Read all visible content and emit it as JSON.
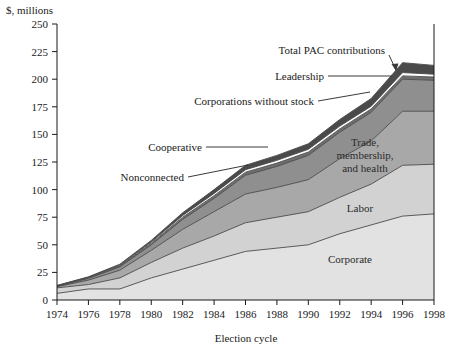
{
  "chart_data": {
    "type": "area",
    "title": "",
    "xlabel": "Election cycle",
    "ylabel": "$, millions",
    "x": [
      1974,
      1976,
      1978,
      1980,
      1982,
      1984,
      1986,
      1988,
      1990,
      1992,
      1994,
      1996,
      1998
    ],
    "xticklabels": [
      "1974",
      "1976",
      "1978",
      "1980",
      "1982",
      "1984",
      "1986",
      "1988",
      "1990",
      "1992",
      "1994",
      "1996",
      "1998"
    ],
    "yticklabels": [
      "0",
      "25",
      "50",
      "75",
      "100",
      "125",
      "150",
      "175",
      "200",
      "225",
      "250"
    ],
    "ylim": [
      0,
      250
    ],
    "xlim": [
      1974,
      1998
    ],
    "ytick_step": 25,
    "grid": false,
    "legend_position": "inline-annotations",
    "stacked": true,
    "series": [
      {
        "name": "Corporate",
        "color": "#e2e2e2",
        "values": [
          6,
          10,
          10,
          20,
          28,
          36,
          44,
          47,
          50,
          60,
          68,
          76,
          78
        ]
      },
      {
        "name": "Labor",
        "color": "#d2d2d2",
        "values": [
          5,
          4,
          10,
          14,
          19,
          22,
          26,
          28,
          30,
          33,
          37,
          46,
          45
        ]
      },
      {
        "name": "Trade, membership, and health",
        "color": "#a8a8a8",
        "values": [
          1,
          4,
          7,
          11,
          17,
          22,
          26,
          27,
          29,
          35,
          39,
          49,
          48
        ]
      },
      {
        "name": "Nonconnected",
        "color": "#8f8f8f",
        "values": [
          0.5,
          1.5,
          3,
          5,
          9,
          12,
          17,
          19,
          22,
          24,
          26,
          29,
          28
        ]
      },
      {
        "name": "Cooperative",
        "color": "#6e6e6e",
        "values": [
          0.3,
          0.7,
          1,
          1.5,
          2,
          2.5,
          2.8,
          3,
          3,
          3,
          3,
          3,
          3
        ]
      },
      {
        "name": "Corporations without stock",
        "color": "#ffffff",
        "values": [
          0.2,
          0.4,
          0.6,
          1,
          1.5,
          2,
          2.2,
          2.5,
          2.5,
          2.5,
          2.5,
          3,
          2.5
        ]
      },
      {
        "name": "Leadership",
        "color": "#4a4a4a",
        "values": [
          0.2,
          0.4,
          0.8,
          1.5,
          2.5,
          3.5,
          4,
          4.5,
          5,
          6,
          7,
          9,
          8
        ]
      }
    ],
    "total_label": "Total PAC contributions",
    "totals": [
      13.2,
      21.0,
      32.4,
      54.0,
      79.0,
      100.0,
      122.0,
      131.0,
      141.5,
      163.5,
      182.5,
      215.0,
      213.0
    ],
    "annotations": [
      {
        "name": "total-pac-contributions",
        "text": "Total PAC contributions",
        "connector": "arrow"
      },
      {
        "name": "leadership",
        "text": "Leadership",
        "connector": "line"
      },
      {
        "name": "corporations-without-stock",
        "text": "Corporations without stock",
        "connector": "line"
      },
      {
        "name": "cooperative",
        "text": "Cooperative",
        "connector": "line"
      },
      {
        "name": "nonconnected",
        "text": "Nonconnected",
        "connector": "line"
      }
    ],
    "inner_labels": [
      {
        "name": "trade-membership-health",
        "lines": [
          "Trade,",
          "membership,",
          "and health"
        ]
      },
      {
        "name": "labor",
        "lines": [
          "Labor"
        ]
      },
      {
        "name": "corporate",
        "lines": [
          "Corporate"
        ]
      }
    ]
  },
  "axes": {
    "y_axis_title": "$, millions",
    "x_axis_title": "Election cycle"
  },
  "colors": {
    "corporate": "#e2e2e2",
    "labor": "#d2d2d2",
    "trade": "#a8a8a8",
    "nonconnected": "#8f8f8f",
    "cooperative": "#6e6e6e",
    "corporations_without_stock": "#ffffff",
    "leadership": "#4a4a4a",
    "axis": "#1a1a1a",
    "background": "#ffffff"
  }
}
